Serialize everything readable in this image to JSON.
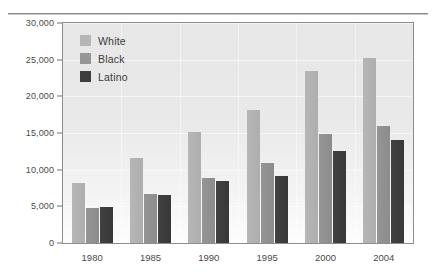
{
  "chart_data": {
    "type": "bar",
    "title": "",
    "xlabel": "",
    "ylabel": "",
    "categories": [
      "1980",
      "1985",
      "1990",
      "1995",
      "2000",
      "2004"
    ],
    "series": [
      {
        "name": "White",
        "color": "#b6b6b6",
        "values": [
          8200,
          11600,
          15200,
          18200,
          23500,
          25200
        ]
      },
      {
        "name": "Black",
        "color": "#959595",
        "values": [
          4800,
          6700,
          8900,
          10900,
          14800,
          16000
        ]
      },
      {
        "name": "Latino",
        "color": "#3d3d3d",
        "values": [
          4900,
          6500,
          8400,
          9200,
          12600,
          14100
        ]
      }
    ],
    "ylim": [
      0,
      30000
    ],
    "ytick_values": [
      0,
      5000,
      10000,
      15000,
      20000,
      25000,
      30000
    ],
    "ytick_labels": [
      "0",
      "5,000",
      "10,000",
      "15,000",
      "20,000",
      "25,000",
      "30,000"
    ],
    "grid": false,
    "legend_position": "top-left",
    "plot_background": "#e9e9e9",
    "frame_color": "#8d8d8d"
  },
  "legend": {
    "entries": [
      {
        "label": "White"
      },
      {
        "label": "Black"
      },
      {
        "label": "Latino"
      }
    ]
  }
}
